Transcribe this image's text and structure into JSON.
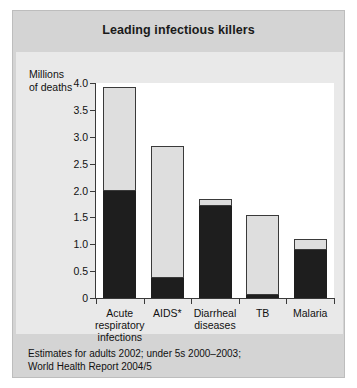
{
  "figure": {
    "title": "Leading infectious killers",
    "source_lines": [
      "Estimates for adults 2002; under 5s 2000–2003;",
      "World Health Report 2004/5"
    ],
    "footnote_marker": "*",
    "footnote_lines": [
      "HIV-positive",
      "persons who",
      "have died with",
      "TB are included",
      "among AIDS",
      "deaths"
    ],
    "colors": {
      "band": "#d4d4d4",
      "panel": "#e9e9e9",
      "plot_background": "#ffffff",
      "series_above5": "#dedede",
      "series_under5": "#1e1e1e",
      "axis": "#3a3a3a"
    }
  },
  "chart_data": {
    "type": "bar",
    "title": "Leading infectious killers",
    "stacked": true,
    "xlabel": "",
    "ylabel": "Millions of deaths",
    "ylabel_lines": [
      "Millions",
      "of deaths"
    ],
    "ylim": [
      0,
      4.0
    ],
    "ytick_values": [
      0,
      0.5,
      1.0,
      1.5,
      2.0,
      2.5,
      3.0,
      3.5,
      4.0
    ],
    "ytick_labels": [
      "0",
      "0.5",
      "1.0",
      "1.5",
      "2.0",
      "2.5",
      "3.0",
      "3.5",
      "4.0"
    ],
    "grid": false,
    "legend_position": "upper right",
    "categories": [
      "Acute respiratory infections",
      "AIDS*",
      "Diarrheal diseases",
      "TB",
      "Malaria"
    ],
    "category_label_lines": [
      [
        "Acute",
        "respiratory",
        "infections"
      ],
      [
        "AIDS*"
      ],
      [
        "Diarrheal",
        "diseases"
      ],
      [
        "TB"
      ],
      [
        "Malaria"
      ]
    ],
    "series": [
      {
        "name": "Under age 5",
        "values": [
          2.0,
          0.37,
          1.72,
          0.05,
          0.9
        ]
      },
      {
        "name": "Age 5 and above",
        "values": [
          1.93,
          2.46,
          0.13,
          1.49,
          0.19
        ]
      }
    ],
    "totals": [
      3.93,
      2.83,
      1.85,
      1.54,
      1.09
    ]
  }
}
